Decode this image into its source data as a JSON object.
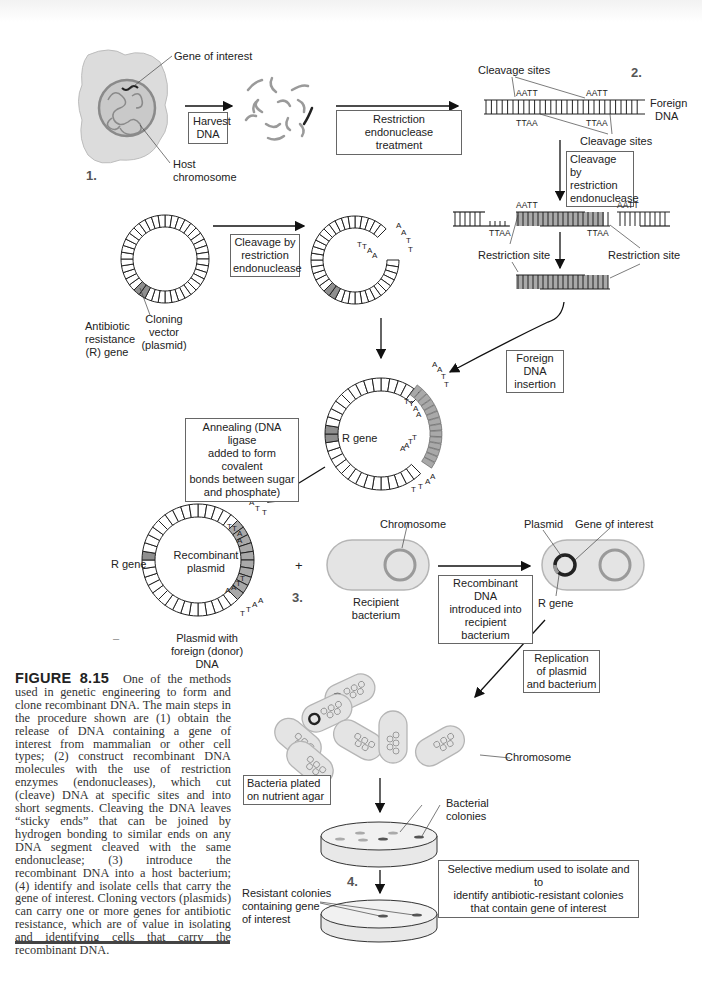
{
  "figure": {
    "number": "FIGURE 8.15",
    "caption": "One of the methods used in genetic engineering to form and clone recombinant DNA. The main steps in the procedure shown are (1) obtain the release of DNA containing a gene of interest from mammalian or other cell types; (2) construct recombinant DNA molecules with the use of restriction enzymes (endonucleases), which cut (cleave) DNA at specific sites and into short segments. Cleaving the DNA leaves “sticky ends” that can be joined by hydrogen bonding to similar ends on any DNA segment cleaved with the same endonuclease; (3) introduce the recombinant DNA into a host bacterium; (4) identify and isolate cells that carry the gene of interest. Cloning vectors (plasmids) can carry one or more genes for antibiotic resistance, which are of value in isolating and identifying cells that carry the recombinant DNA."
  },
  "steps": [
    "1.",
    "2.",
    "3.",
    "4."
  ],
  "labels": {
    "gene_of_interest": "Gene of interest",
    "host_chromosome_1": "Host",
    "host_chromosome_2": "chromosome",
    "cleavage_sites_top": "Cleavage sites",
    "cleavage_sites_bottom": "Cleavage sites",
    "foreign_dna_1": "Foreign",
    "foreign_dna_2": "DNA",
    "restriction_site_left": "Restriction site",
    "restriction_site_right": "Restriction site",
    "antibiotic_1": "Antibiotic",
    "antibiotic_2": "resistance",
    "antibiotic_3": "(R) gene",
    "cloning_1": "Cloning",
    "cloning_2": "vector",
    "cloning_3": "(plasmid)",
    "r_gene_mid": "R gene",
    "r_gene_left": "R gene",
    "recombinant_1": "Recombinant",
    "recombinant_2": "plasmid",
    "plasmid_with_1": "Plasmid with",
    "plasmid_with_2": "foreign (donor)",
    "plasmid_with_3": "DNA",
    "chromosome_top": "Chromosome",
    "recipient_1": "Recipient",
    "recipient_2": "bacterium",
    "plasmid": "Plasmid",
    "gene_of_interest_2": "Gene of interest",
    "r_gene_bact": "R gene",
    "chromosome_cluster": "Chromosome",
    "bacterial_1": "Bacterial",
    "bacterial_2": "colonies",
    "resistant_1": "Resistant colonies",
    "resistant_2": "containing gene",
    "resistant_3": "of interest",
    "plus": "+",
    "dash": "–"
  },
  "sequences": {
    "aatt": "AATT",
    "ttaa": "TTAA"
  },
  "boxes": {
    "harvest": [
      "Harvest",
      "DNA"
    ],
    "restriction_treatment": [
      "Restriction endonuclease",
      "treatment"
    ],
    "cleavage_right": [
      "Cleavage by",
      "restriction",
      "endonuclease"
    ],
    "cleavage_left": [
      "Cleavage by",
      "restriction",
      "endonuclease"
    ],
    "foreign_insertion": [
      "Foreign DNA",
      "insertion"
    ],
    "annealing": [
      "Annealing (DNA ligase",
      "added to form covalent",
      "bonds between sugar",
      "and phosphate)"
    ],
    "recombinant_intro": [
      "Recombinant DNA",
      "introduced into",
      "recipient bacterium"
    ],
    "replication": [
      "Replication",
      "of plasmid",
      "and bacterium"
    ],
    "plated": [
      "Bacteria plated",
      "on nutrient agar"
    ],
    "selective": [
      "Selective medium used to isolate and to",
      "identify antibiotic-resistant colonies",
      "that contain gene of interest"
    ]
  },
  "colors": {
    "cell_fill": "#dcdcdc",
    "nucleus_fill": "#c8c8c8",
    "gray_stroke": "#8a8a8a",
    "foreign_fill": "#a9a9a9",
    "line": "#222222"
  }
}
